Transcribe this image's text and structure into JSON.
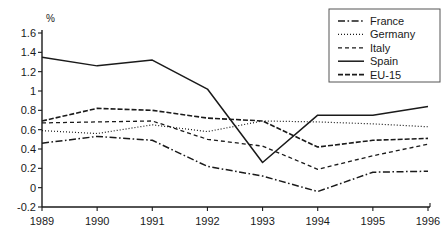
{
  "chart_data": {
    "type": "line",
    "title": "",
    "xlabel": "",
    "ylabel": "%",
    "unit_label": "%",
    "categories": [
      "1989",
      "1990",
      "1991",
      "1992",
      "1993",
      "1994",
      "1995",
      "1996"
    ],
    "x": [
      1989,
      1990,
      1991,
      1992,
      1993,
      1994,
      1995,
      1996
    ],
    "xlim": [
      1989,
      1996
    ],
    "ylim": [
      -0.2,
      1.6
    ],
    "ytick_labels": [
      "1.6",
      "1.4",
      "1.2",
      "1",
      "0.8",
      "0.6",
      "0.4",
      "0.2",
      "0",
      "-0.2"
    ],
    "yticks": [
      1.6,
      1.4,
      1.2,
      1.0,
      0.8,
      0.6,
      0.4,
      0.2,
      0.0,
      -0.2
    ],
    "ytick_step": 0.2,
    "grid": false,
    "legend_position": "top-right",
    "series": [
      {
        "name": "France",
        "style": "dashdot",
        "color": "#1a1a1a",
        "values": [
          0.46,
          0.53,
          0.49,
          0.22,
          0.12,
          -0.04,
          0.16,
          0.17
        ]
      },
      {
        "name": "Germany",
        "style": "dotted",
        "color": "#1a1a1a",
        "values": [
          0.59,
          0.56,
          0.65,
          0.58,
          0.69,
          0.68,
          0.66,
          0.63
        ]
      },
      {
        "name": "Italy",
        "style": "dashed",
        "color": "#1a1a1a",
        "values": [
          0.67,
          0.68,
          0.69,
          0.5,
          0.43,
          0.19,
          0.33,
          0.45
        ]
      },
      {
        "name": "Spain",
        "style": "solid",
        "color": "#1a1a1a",
        "values": [
          1.35,
          1.26,
          1.32,
          1.02,
          0.26,
          0.75,
          0.75,
          0.84
        ]
      },
      {
        "name": "EU-15",
        "style": "dashed-bold",
        "color": "#1a1a1a",
        "values": [
          0.69,
          0.82,
          0.8,
          0.72,
          0.69,
          0.42,
          0.49,
          0.51
        ]
      }
    ]
  },
  "legend": {
    "entries": [
      "France",
      "Germany",
      "Italy",
      "Spain",
      "EU-15"
    ]
  }
}
